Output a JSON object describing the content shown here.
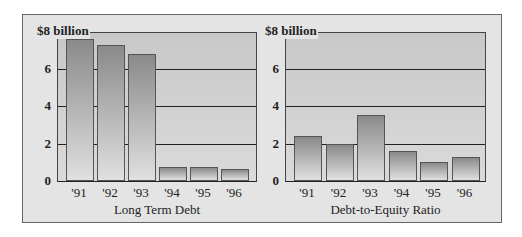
{
  "chart_data": [
    {
      "type": "bar",
      "title": "",
      "xlabel": "Long Term Debt",
      "ylabel": "",
      "top_label": "$8 billion",
      "categories": [
        "'91",
        "'92",
        "'93",
        "'94",
        "'95",
        "'96"
      ],
      "values": [
        7.6,
        7.25,
        6.8,
        0.75,
        0.75,
        0.65
      ],
      "ylim": [
        0,
        8
      ],
      "yticks": [
        "0",
        "2",
        "4",
        "6"
      ],
      "grid": true,
      "legend": null
    },
    {
      "type": "bar",
      "title": "",
      "xlabel": "Debt-to-Equity Ratio",
      "ylabel": "",
      "top_label": "$8 billion",
      "categories": [
        "'91",
        "'92",
        "'93",
        "'94",
        "'95",
        "'96"
      ],
      "values": [
        2.4,
        2.0,
        3.5,
        1.6,
        1.0,
        1.3
      ],
      "ylim": [
        0,
        8
      ],
      "yticks": [
        "0",
        "2",
        "4",
        "6"
      ],
      "grid": true,
      "legend": null
    }
  ],
  "colors": {
    "frame_bg": "#e4e4e4",
    "plot_bg": "#d0d0d0",
    "bar_top": "#8a8a8a",
    "bar_bottom": "#e0e0e0",
    "gridline": "#222222"
  }
}
